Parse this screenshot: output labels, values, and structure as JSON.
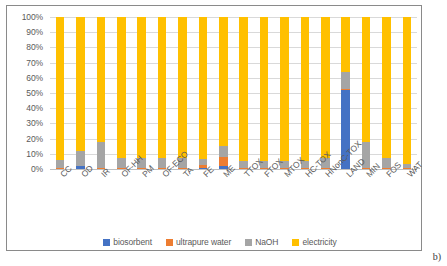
{
  "panel_label": "b)",
  "chart_data": {
    "type": "bar",
    "subtype": "stacked-percent",
    "title": "",
    "xlabel": "",
    "ylabel": "",
    "ylim": [
      0,
      100
    ],
    "grid": true,
    "legend_position": "bottom",
    "y_ticks": [
      "0%",
      "10%",
      "20%",
      "30%",
      "40%",
      "50%",
      "60%",
      "70%",
      "80%",
      "90%",
      "100%"
    ],
    "y_tick_values": [
      0,
      10,
      20,
      30,
      40,
      50,
      60,
      70,
      80,
      90,
      100
    ],
    "categories": [
      "CC",
      "OD",
      "IR",
      "OF-HH",
      "PM",
      "OF-ECO",
      "TA",
      "FE",
      "ME",
      "TTOX",
      "FTOX",
      "MTOX",
      "HC-TOX",
      "HNonC-TOX",
      "LAND",
      "MIN",
      "FOS",
      "WAT"
    ],
    "series": [
      {
        "name": "biosorbent",
        "color": "#4472C4",
        "values": [
          0.3,
          2.0,
          0.3,
          0.3,
          0.3,
          0.3,
          0.3,
          0.5,
          2.0,
          0.3,
          0.3,
          0.3,
          0.3,
          0.5,
          52.0,
          0.5,
          0.3,
          0.3
        ]
      },
      {
        "name": "ultrapure water",
        "color": "#ED7D31",
        "values": [
          0.2,
          0.3,
          0.2,
          0.2,
          0.2,
          0.2,
          0.2,
          2.0,
          6.0,
          0.2,
          0.2,
          0.2,
          0.2,
          0.3,
          0.5,
          0.3,
          0.2,
          0.2
        ]
      },
      {
        "name": "NaOH",
        "color": "#A5A5A5",
        "values": [
          5.5,
          9.7,
          17.5,
          6.5,
          6.5,
          6.5,
          6.5,
          4.0,
          7.0,
          5.0,
          5.0,
          5.0,
          5.0,
          6.2,
          11.5,
          17.2,
          6.5,
          2.5
        ]
      },
      {
        "name": "electricity",
        "color": "#FFC000",
        "values": [
          94.0,
          88.0,
          82.0,
          93.0,
          93.0,
          93.0,
          93.0,
          93.5,
          85.0,
          94.5,
          94.5,
          94.5,
          94.5,
          93.0,
          36.0,
          82.0,
          93.0,
          97.0
        ]
      }
    ]
  }
}
